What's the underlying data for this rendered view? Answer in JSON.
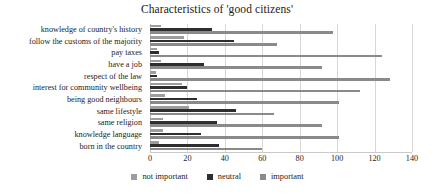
{
  "chart_data": {
    "type": "bar",
    "orientation": "horizontal",
    "title": "Characteristics of 'good citizens'",
    "xlabel": "",
    "ylabel": "",
    "xlim": [
      0,
      140
    ],
    "xticks": [
      0,
      20,
      40,
      60,
      80,
      100,
      120,
      140
    ],
    "grid": true,
    "legend_position": "bottom",
    "categories": [
      "knowledge of country's history",
      "follow the customs of the majority",
      "pay taxes",
      "have a job",
      "respect of the law",
      "interest for community wellbeing",
      "being good neighbours",
      "same lifestyle",
      "same religion",
      "knowledge language",
      "born in the country"
    ],
    "series": [
      {
        "name": "not important",
        "color": "#9d9d9d",
        "values": [
          6,
          18,
          4,
          6,
          3,
          17,
          8,
          21,
          7,
          7,
          5
        ]
      },
      {
        "name": "neutral",
        "color": "#2e2e2e",
        "values": [
          33,
          45,
          5,
          29,
          4,
          20,
          25,
          46,
          36,
          27,
          37
        ]
      },
      {
        "name": "important",
        "color": "#8a8a8a",
        "values": [
          98,
          68,
          124,
          92,
          128,
          112,
          101,
          66,
          92,
          101,
          60
        ]
      }
    ]
  },
  "legend": {
    "items": [
      {
        "label": "not important"
      },
      {
        "label": "neutral"
      },
      {
        "label": "important"
      }
    ]
  }
}
